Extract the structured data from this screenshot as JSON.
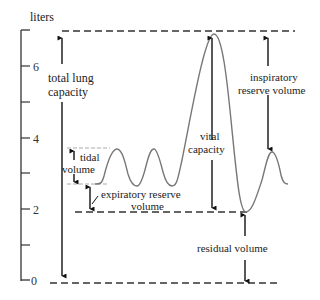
{
  "diagram": {
    "type": "spirogram",
    "axis": {
      "unit_label": "liters",
      "ticks": [
        {
          "value": "6",
          "y": 66
        },
        {
          "value": "4",
          "y": 138
        },
        {
          "value": "2",
          "y": 209
        },
        {
          "value": "0",
          "y": 280
        }
      ],
      "minor_ticks_y": [
        31,
        102,
        173,
        245
      ]
    },
    "labels": {
      "total_lung_capacity_1": "total lung",
      "total_lung_capacity_2": "capacity",
      "tidal_volume_1": "tidal",
      "tidal_volume_2": "volume",
      "expiratory_reserve_1": "expiratory reserve",
      "expiratory_reserve_2": "volume",
      "vital_capacity_1": "vital",
      "vital_capacity_2": "capacity",
      "inspiratory_reserve_1": "inspiratory",
      "inspiratory_reserve_2": "reserve volume",
      "residual_volume": "residual volume"
    },
    "levels_liters": {
      "total_lung_capacity": 7.0,
      "tidal_peak": 3.7,
      "tidal_trough": 2.7,
      "residual": 1.9,
      "zero": 0
    },
    "colors": {
      "curve": "#777777",
      "arrows": "#111111",
      "dashes": "#333333",
      "dotted_guides": "#aaaaaa"
    }
  }
}
